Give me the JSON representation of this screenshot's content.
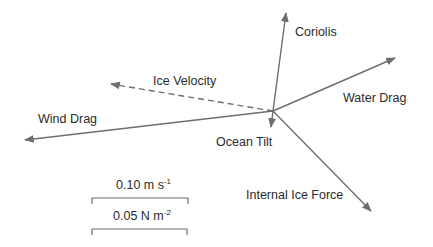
{
  "diagram": {
    "type": "force-vector-diagram",
    "origin": [
      273,
      111
    ],
    "colors": {
      "line": "#6e6e6e",
      "text": "#2b2b2b",
      "background": "#ffffff"
    },
    "vectors": [
      {
        "id": "coriolis",
        "label": "Coriolis",
        "tip": [
          286,
          13
        ],
        "style": "solid",
        "label_pos": [
          295,
          26
        ]
      },
      {
        "id": "water-drag",
        "label": "Water Drag",
        "tip": [
          395,
          58
        ],
        "style": "solid",
        "label_pos": [
          343,
          92
        ]
      },
      {
        "id": "ice-velocity",
        "label": "Ice Velocity",
        "tip": [
          111,
          84
        ],
        "style": "dashed",
        "label_pos": [
          153,
          75
        ]
      },
      {
        "id": "wind-drag",
        "label": "Wind Drag",
        "tip": [
          25,
          140
        ],
        "style": "solid",
        "label_pos": [
          38,
          113
        ]
      },
      {
        "id": "ocean-tilt",
        "label": "Ocean Tilt",
        "tip": [
          271,
          127
        ],
        "style": "solid",
        "label_pos": [
          216,
          136
        ]
      },
      {
        "id": "internal-ice-force",
        "label": "Internal Ice Force",
        "tip": [
          371,
          211
        ],
        "style": "solid",
        "label_pos": [
          246,
          189
        ]
      }
    ],
    "scale_bars": [
      {
        "id": "velocity-scale",
        "value": "0.10 m s",
        "exponent": "-1",
        "x1": 92,
        "x2": 188,
        "y": 198,
        "label_pos": [
          116,
          178
        ]
      },
      {
        "id": "stress-scale",
        "value": "0.05 N m",
        "exponent": "-2",
        "x1": 92,
        "x2": 187,
        "y": 229,
        "label_pos": [
          113,
          209
        ]
      }
    ]
  }
}
